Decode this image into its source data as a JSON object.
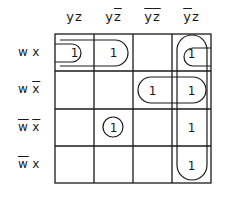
{
  "diagram": {
    "type": "karnaugh-map",
    "variables": [
      "w",
      "x",
      "y",
      "z"
    ],
    "columns": [
      {
        "label": "yz",
        "parts": [
          {
            "t": "y",
            "bar": false
          },
          {
            "t": "z",
            "bar": false
          }
        ]
      },
      {
        "label": "yz̄",
        "parts": [
          {
            "t": "y",
            "bar": false
          },
          {
            "t": "z",
            "bar": true
          }
        ]
      },
      {
        "label": "ȳz̄",
        "parts": [
          {
            "t": "y",
            "bar": true
          },
          {
            "t": "z",
            "bar": true
          }
        ]
      },
      {
        "label": "ȳz",
        "parts": [
          {
            "t": "y",
            "bar": true
          },
          {
            "t": "z",
            "bar": false
          }
        ]
      }
    ],
    "rows": [
      {
        "label": "wx",
        "parts": [
          {
            "t": "w",
            "bar": false
          },
          {
            "t": "x",
            "bar": false
          }
        ]
      },
      {
        "label": "wx̄",
        "parts": [
          {
            "t": "w",
            "bar": false
          },
          {
            "t": "x",
            "bar": true
          }
        ]
      },
      {
        "label": "w̄x̄",
        "parts": [
          {
            "t": "w",
            "bar": true
          },
          {
            "t": "x",
            "bar": true
          }
        ]
      },
      {
        "label": "w̄x",
        "parts": [
          {
            "t": "w",
            "bar": true
          },
          {
            "t": "x",
            "bar": false
          }
        ]
      }
    ],
    "cells": [
      [
        "1",
        "1",
        "",
        "1"
      ],
      [
        "",
        "",
        "1",
        "1"
      ],
      [
        "",
        "1",
        "",
        "1"
      ],
      [
        "",
        "",
        "",
        "1"
      ]
    ],
    "groupings": [
      {
        "name": "wx-y",
        "row_start": 0,
        "row_end": 0,
        "col_start": 0,
        "col_end": 1,
        "shape": "horizontal-capsule"
      },
      {
        "name": "wx-z-wraparound",
        "row_start": 0,
        "row_end": 0,
        "cols": [
          0,
          3
        ],
        "shape": "wraparound-half-capsules"
      },
      {
        "name": "wxbar-ybar",
        "row_start": 1,
        "row_end": 1,
        "col_start": 2,
        "col_end": 3,
        "shape": "horizontal-capsule"
      },
      {
        "name": "ybar-z",
        "row_start": 0,
        "row_end": 3,
        "col_start": 3,
        "col_end": 3,
        "shape": "vertical-capsule"
      },
      {
        "name": "wbar-xbar-y-zbar",
        "row_start": 2,
        "row_end": 2,
        "col_start": 1,
        "col_end": 1,
        "shape": "circle"
      }
    ],
    "colors": {
      "ink": "#1a1a1a",
      "background": "#ffffff"
    }
  }
}
